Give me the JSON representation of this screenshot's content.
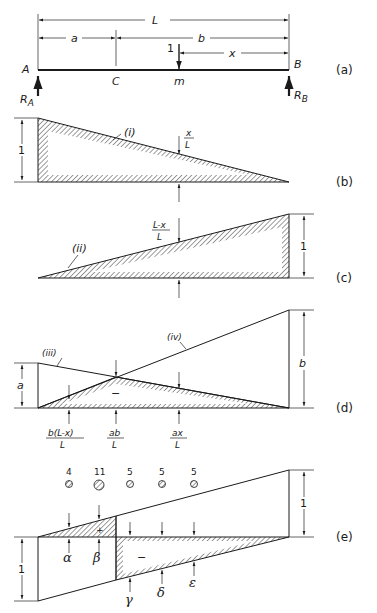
{
  "panels": {
    "a": {
      "label": "(a)",
      "dim_L": "L",
      "dim_a": "a",
      "dim_b": "b",
      "dim_x": "x",
      "load": "1",
      "point_A": "A",
      "point_B": "B",
      "point_C": "C",
      "point_m": "m",
      "reaction_A": "R",
      "reaction_A_sub": "A",
      "reaction_B": "R",
      "reaction_B_sub": "B"
    },
    "b": {
      "label": "(b)",
      "curve": "(i)",
      "height": "1",
      "ord_num": "x",
      "ord_den": "L"
    },
    "c": {
      "label": "(c)",
      "curve": "(ii)",
      "height": "1",
      "ord_num": "L-x",
      "ord_den": "L"
    },
    "d": {
      "label": "(d)",
      "curve_iii": "(iii)",
      "curve_iv": "(iv)",
      "height_a": "a",
      "height_b": "b",
      "sign": "−",
      "ord1_num": "b(L-x)",
      "ord1_den": "L",
      "ord2_num": "ab",
      "ord2_den": "L",
      "ord3_num": "ax",
      "ord3_den": "L"
    },
    "e": {
      "label": "(e)",
      "height_left": "1",
      "height_right": "1",
      "sign_plus": "+",
      "sign_minus": "−",
      "loads": [
        {
          "value": "4",
          "size": "small"
        },
        {
          "value": "11",
          "size": "large"
        },
        {
          "value": "5",
          "size": "small"
        },
        {
          "value": "5",
          "size": "small"
        },
        {
          "value": "5",
          "size": "small"
        }
      ],
      "ordinates": [
        "α",
        "β",
        "γ",
        "δ",
        "ε"
      ]
    }
  }
}
